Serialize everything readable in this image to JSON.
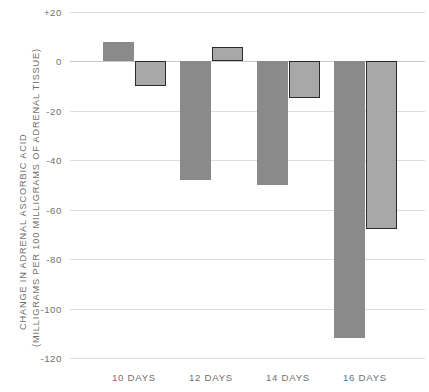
{
  "chart_data": {
    "type": "bar",
    "title": "",
    "xlabel": "",
    "ylabel_line1": "CHANGE IN ADRENAL ASCORBIC ACID",
    "ylabel_line2": "(MILLIGRAMS PER 100 MILLIGRAMS OF ADRENAL TISSUE)",
    "categories": [
      "10 DAYS",
      "12 DAYS",
      "14 DAYS",
      "16 DAYS"
    ],
    "series": [
      {
        "name": "series-a",
        "color": "#8a8a8a",
        "outline": false,
        "values": [
          8,
          -48,
          -50,
          -112
        ]
      },
      {
        "name": "series-b",
        "color": "#a8a8a8",
        "outline": true,
        "outline_color": "#2b2b2b",
        "values": [
          -10,
          6,
          -15,
          -68
        ]
      }
    ],
    "ylim": [
      -120,
      20
    ],
    "yticks": [
      20,
      0,
      -20,
      -40,
      -60,
      -80,
      -100,
      -120
    ],
    "ytick_labels": [
      "+20",
      "0",
      "-20",
      "-40",
      "-60",
      "-80",
      "-100",
      "-120"
    ],
    "grid": true,
    "legend": "none",
    "grid_color": "#dcdcdc",
    "zero_line_color": "#c9c9c9",
    "text_color": "#6f6f6f",
    "background": "#ffffff"
  },
  "layout": {
    "plot_left": 70,
    "plot_width": 355,
    "y_top_px": 12,
    "y_bottom_px": 358,
    "bar_width": 31,
    "group_centers": [
      134,
      211,
      288,
      365
    ],
    "pair_gap": 1
  }
}
